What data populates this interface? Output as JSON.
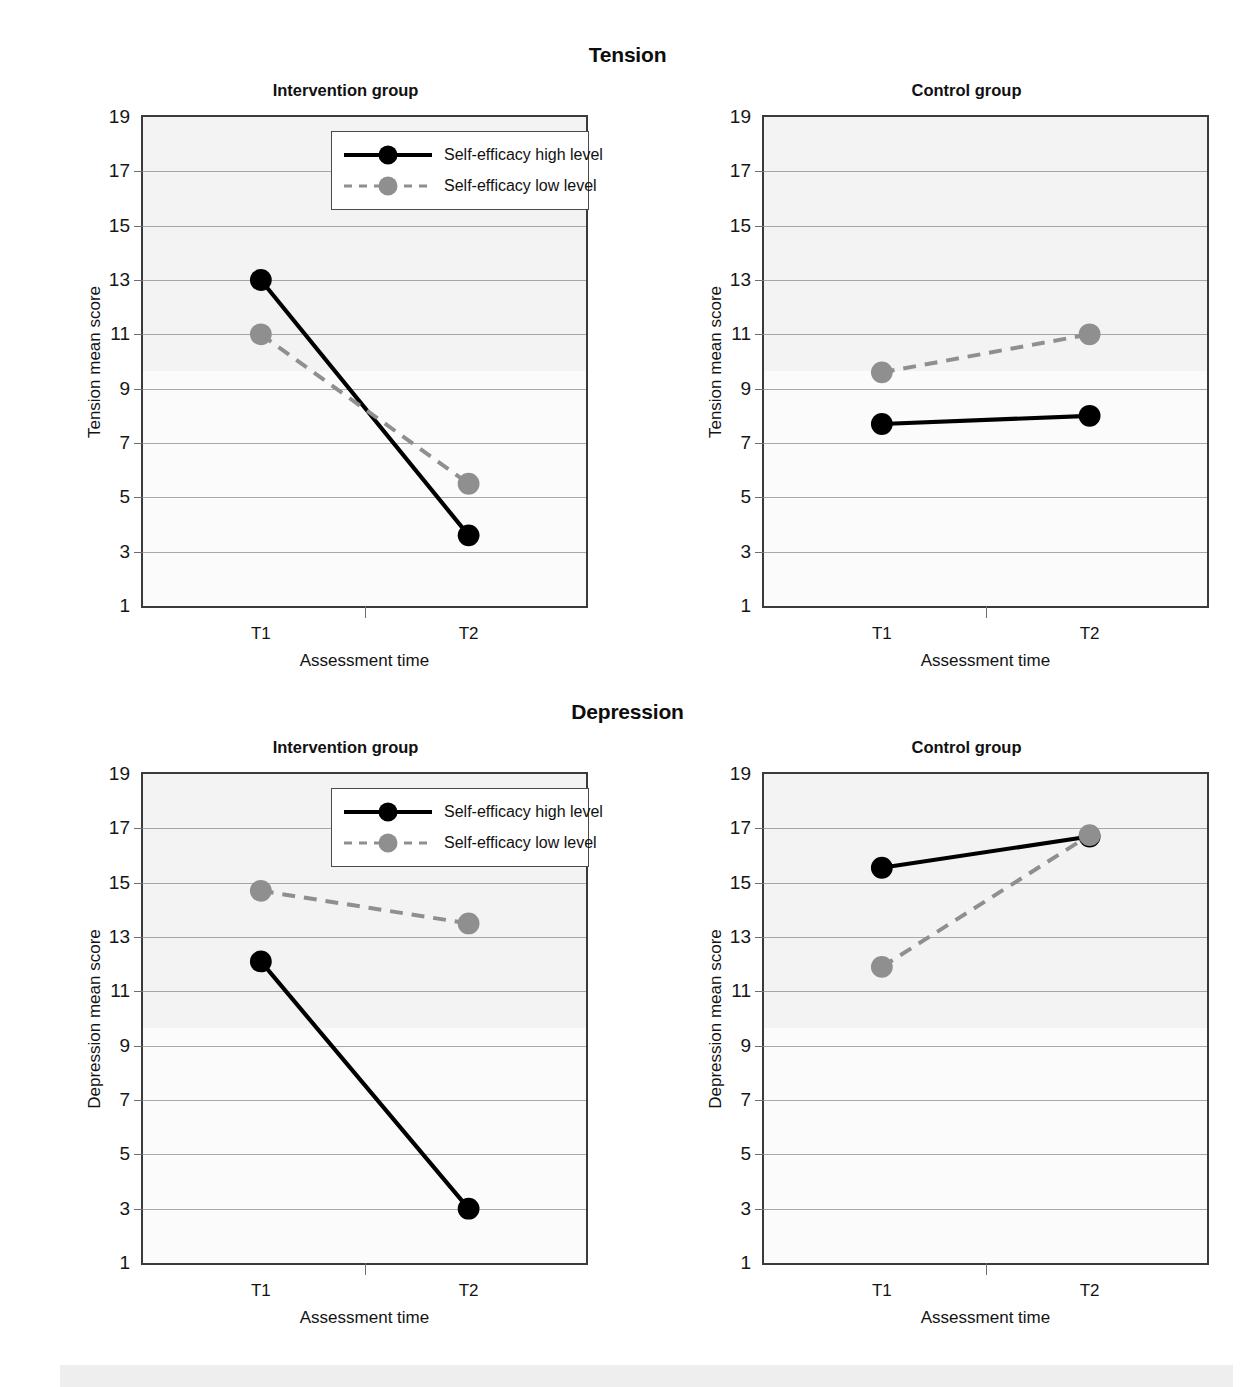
{
  "figure": {
    "sections": [
      {
        "id": "tension",
        "super_title": "Tension"
      },
      {
        "id": "depression",
        "super_title": "Depression"
      }
    ]
  },
  "axis": {
    "y_ticks": [
      "19",
      "17",
      "15",
      "13",
      "11",
      "9",
      "7",
      "5",
      "3",
      "1"
    ],
    "y_min": 1,
    "y_max": 19,
    "x_ticks": [
      "T1",
      "T2"
    ],
    "x_title": "Assessment time"
  },
  "legend": {
    "items": [
      {
        "label": "Self-efficacy high level",
        "style": "solid",
        "color": "#000000",
        "marker": "circle-black"
      },
      {
        "label": "Self-efficacy low level",
        "style": "dashed",
        "color": "#8f8f8f",
        "marker": "circle-gray"
      }
    ]
  },
  "panels": [
    {
      "id": "tension-intervention",
      "title": "Intervention group",
      "y_title": "Tension mean score",
      "has_legend": true
    },
    {
      "id": "tension-control",
      "title": "Control group",
      "y_title": "Tension mean score",
      "has_legend": false
    },
    {
      "id": "depression-intervention",
      "title": "Intervention group",
      "y_title": "Depression mean score",
      "has_legend": true
    },
    {
      "id": "depression-control",
      "title": "Control group",
      "y_title": "Depression mean score",
      "has_legend": false
    }
  ],
  "colors": {
    "high_level_line": "#000000",
    "low_level_line": "#8f8f8f",
    "plot_background": "#f3f3f3",
    "gridline": "#8c8c8c",
    "frame": "#3a3a3a"
  },
  "chart_data": [
    {
      "type": "line",
      "id": "tension-intervention",
      "title": "Intervention group",
      "super_title": "Tension",
      "xlabel": "Assessment time",
      "ylabel": "Tension mean score",
      "categories": [
        "T1",
        "T2"
      ],
      "ylim": [
        1,
        19
      ],
      "yticks": [
        1,
        3,
        5,
        7,
        9,
        11,
        13,
        15,
        17,
        19
      ],
      "grid": true,
      "legend_position": "top-right inside",
      "series": [
        {
          "name": "Self-efficacy high level",
          "values": [
            13.0,
            3.6
          ],
          "style": "solid",
          "color": "#000000"
        },
        {
          "name": "Self-efficacy low level",
          "values": [
            11.0,
            5.5
          ],
          "style": "dashed",
          "color": "#8f8f8f"
        }
      ]
    },
    {
      "type": "line",
      "id": "tension-control",
      "title": "Control group",
      "super_title": "Tension",
      "xlabel": "Assessment time",
      "ylabel": "Tension mean score",
      "categories": [
        "T1",
        "T2"
      ],
      "ylim": [
        1,
        19
      ],
      "yticks": [
        1,
        3,
        5,
        7,
        9,
        11,
        13,
        15,
        17,
        19
      ],
      "grid": true,
      "legend_position": "none",
      "series": [
        {
          "name": "Self-efficacy high level",
          "values": [
            7.7,
            8.0
          ],
          "style": "solid",
          "color": "#000000"
        },
        {
          "name": "Self-efficacy low level",
          "values": [
            9.6,
            11.0
          ],
          "style": "dashed",
          "color": "#8f8f8f"
        }
      ]
    },
    {
      "type": "line",
      "id": "depression-intervention",
      "title": "Intervention group",
      "super_title": "Depression",
      "xlabel": "Assessment time",
      "ylabel": "Depression mean score",
      "categories": [
        "T1",
        "T2"
      ],
      "ylim": [
        1,
        19
      ],
      "yticks": [
        1,
        3,
        5,
        7,
        9,
        11,
        13,
        15,
        17,
        19
      ],
      "grid": true,
      "legend_position": "top-right inside",
      "series": [
        {
          "name": "Self-efficacy high level",
          "values": [
            12.1,
            3.0
          ],
          "style": "solid",
          "color": "#000000"
        },
        {
          "name": "Self-efficacy low level",
          "values": [
            14.7,
            13.5
          ],
          "style": "dashed",
          "color": "#8f8f8f"
        }
      ]
    },
    {
      "type": "line",
      "id": "depression-control",
      "title": "Control group",
      "super_title": "Depression",
      "xlabel": "Assessment time",
      "ylabel": "Depression mean score",
      "categories": [
        "T1",
        "T2"
      ],
      "ylim": [
        1,
        19
      ],
      "yticks": [
        1,
        3,
        5,
        7,
        9,
        11,
        13,
        15,
        17,
        19
      ],
      "grid": true,
      "legend_position": "none",
      "series": [
        {
          "name": "Self-efficacy high level",
          "values": [
            15.55,
            16.7
          ],
          "style": "solid",
          "color": "#000000"
        },
        {
          "name": "Self-efficacy low level",
          "values": [
            11.9,
            16.75
          ],
          "style": "dashed",
          "color": "#8f8f8f"
        }
      ]
    }
  ]
}
